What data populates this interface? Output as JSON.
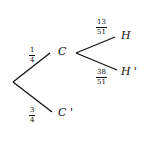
{
  "diagram": {
    "type": "probability-tree",
    "nodes": {
      "c": "C",
      "c_prime": "C '",
      "h": "H",
      "h_prime": "H '"
    },
    "branches": {
      "root_to_c": {
        "num": "1",
        "den": "4"
      },
      "root_to_c_prime": {
        "num": "3",
        "den": "4"
      },
      "c_to_h": {
        "num": "13",
        "den": "51"
      },
      "c_to_h_prime": {
        "num": "38",
        "den": "51"
      }
    },
    "line_color": "#111111"
  }
}
